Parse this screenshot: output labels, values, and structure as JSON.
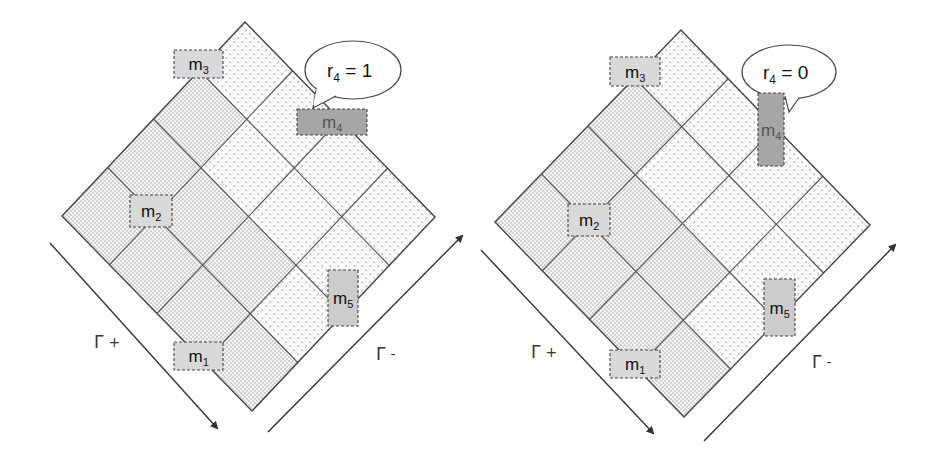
{
  "figure": {
    "panels": [
      {
        "id": "left",
        "title": "",
        "diamond": {
          "top": [
            245,
            22
          ],
          "left": [
            62,
            216
          ],
          "right": [
            435,
            217
          ],
          "grid_n": 4
        },
        "fine_cells": [
          [
            1,
            0
          ],
          [
            2,
            0
          ],
          [
            3,
            0
          ],
          [
            2,
            1
          ],
          [
            3,
            1
          ],
          [
            3,
            2
          ],
          [
            3,
            3
          ],
          [
            2,
            2
          ]
        ],
        "coarse_cells": [
          [
            0,
            0
          ],
          [
            0,
            1
          ],
          [
            0,
            2
          ],
          [
            0,
            3
          ],
          [
            1,
            1
          ],
          [
            1,
            2
          ],
          [
            1,
            3
          ],
          [
            2,
            3
          ]
        ],
        "callout": {
          "text_main": "r",
          "text_sub": "4",
          "text_rest": " = 1",
          "cx": 353,
          "cy": 70,
          "rx": 48,
          "ry": 29,
          "tail": [
            [
              316,
              90
            ],
            [
              313,
              108
            ],
            [
              336,
              96
            ]
          ]
        },
        "boxes": [
          {
            "label": "m",
            "sub": "3",
            "x": 174,
            "y": 50,
            "w": 49,
            "h": 28,
            "fill": "#d9d9d9"
          },
          {
            "label": "m",
            "sub": "4",
            "x": 297,
            "y": 109,
            "w": 70,
            "h": 26,
            "fill": "#a6a6a6",
            "textfill": "#555555"
          },
          {
            "label": "m",
            "sub": "2",
            "x": 130,
            "y": 195,
            "w": 42,
            "h": 32,
            "fill": "#d9d9d9"
          },
          {
            "label": "m",
            "sub": "5",
            "x": 328,
            "y": 270,
            "w": 30,
            "h": 56,
            "fill": "#cccccc"
          },
          {
            "label": "m",
            "sub": "1",
            "x": 174,
            "y": 342,
            "w": 49,
            "h": 28,
            "fill": "#d9d9d9"
          }
        ],
        "arrows": [
          {
            "name": "gamma-plus-arrow",
            "from": [
              50,
              243
            ],
            "to": [
              217,
              428
            ]
          },
          {
            "name": "gamma-minus-arrow",
            "from": [
              268,
              432
            ],
            "to": [
              462,
              236
            ]
          }
        ],
        "gamma_labels": [
          {
            "name": "gamma-plus-label",
            "symbol": "Γ",
            "sign": "+",
            "x": 94,
            "y": 348
          },
          {
            "name": "gamma-minus-label",
            "symbol": "Γ",
            "sign": "-",
            "x": 376,
            "y": 360
          }
        ]
      },
      {
        "id": "right",
        "title": "",
        "diamond": {
          "top": [
            681,
            30
          ],
          "left": [
            495,
            222
          ],
          "right": [
            870,
            225
          ],
          "grid_n": 4
        },
        "fine_cells": [
          [
            1,
            0
          ],
          [
            2,
            0
          ],
          [
            3,
            0
          ],
          [
            2,
            1
          ],
          [
            3,
            1
          ],
          [
            3,
            2
          ],
          [
            2,
            2
          ],
          [
            3,
            3
          ]
        ],
        "coarse_cells": [
          [
            0,
            0
          ],
          [
            0,
            1
          ],
          [
            0,
            2
          ],
          [
            0,
            3
          ],
          [
            1,
            1
          ],
          [
            1,
            2
          ],
          [
            1,
            3
          ],
          [
            2,
            3
          ]
        ],
        "callout": {
          "text_main": "r",
          "text_sub": "4",
          "text_rest": " = 0",
          "cx": 789,
          "cy": 72,
          "rx": 47,
          "ry": 27,
          "tail": [
            [
              785,
              96
            ],
            [
              789,
              112
            ],
            [
              799,
              98
            ]
          ]
        },
        "boxes": [
          {
            "label": "m",
            "sub": "3",
            "x": 610,
            "y": 57,
            "w": 50,
            "h": 29,
            "fill": "#d9d9d9"
          },
          {
            "label": "m",
            "sub": "4",
            "x": 758,
            "y": 93,
            "w": 26,
            "h": 73,
            "fill": "#a6a6a6",
            "textfill": "#555555"
          },
          {
            "label": "m",
            "sub": "2",
            "x": 568,
            "y": 204,
            "w": 42,
            "h": 32,
            "fill": "#d9d9d9"
          },
          {
            "label": "m",
            "sub": "5",
            "x": 764,
            "y": 279,
            "w": 31,
            "h": 57,
            "fill": "#cccccc"
          },
          {
            "label": "m",
            "sub": "1",
            "x": 610,
            "y": 350,
            "w": 50,
            "h": 28,
            "fill": "#d9d9d9"
          }
        ],
        "arrows": [
          {
            "name": "gamma-plus-arrow",
            "from": [
              481,
              250
            ],
            "to": [
              653,
              433
            ]
          },
          {
            "name": "gamma-minus-arrow",
            "from": [
              704,
              441
            ],
            "to": [
              895,
              245
            ]
          }
        ],
        "gamma_labels": [
          {
            "name": "gamma-plus-label",
            "symbol": "Γ",
            "sign": "+",
            "x": 531,
            "y": 358
          },
          {
            "name": "gamma-minus-label",
            "symbol": "Γ",
            "sign": "-",
            "x": 812,
            "y": 368
          }
        ]
      }
    ],
    "colors": {
      "grid_line": "#555555",
      "outline": "#444444",
      "fine_dot": "#9a9a9a",
      "coarse_dot": "#8a8a8a",
      "box_border": "#444444",
      "callout_border": "#444444",
      "arrow": "#333333"
    }
  }
}
